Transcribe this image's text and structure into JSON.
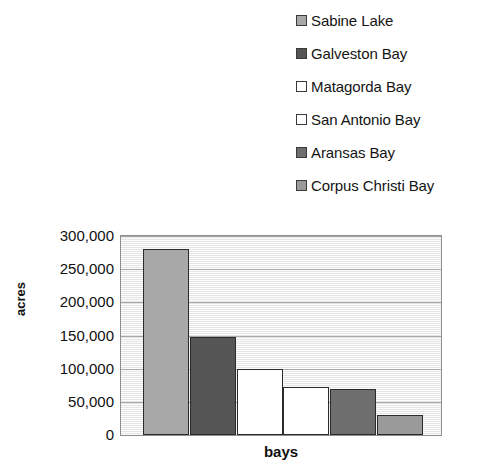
{
  "chart_data": {
    "type": "bar",
    "title": "",
    "xlabel": "bays",
    "ylabel": "acres",
    "categories": [
      "Sabine Lake",
      "Galveston Bay",
      "Matagorda Bay",
      "San Antonio Bay",
      "Aransas Bay",
      "Corpus Christi Bay"
    ],
    "values": [
      280000,
      148000,
      100000,
      72000,
      69000,
      30000
    ],
    "ylim": [
      0,
      300000
    ],
    "ytick_values": [
      0,
      50000,
      100000,
      150000,
      200000,
      250000,
      300000
    ],
    "ytick_labels": [
      "0",
      "50,000",
      "100,000",
      "150,000",
      "200,000",
      "250,000",
      "300,000"
    ],
    "grid": true,
    "legend_position": "top-right",
    "colors": [
      "#a8a8a8",
      "#555555",
      "#ffffff",
      "#ffffff",
      "#6e6e6e",
      "#9a9a9a"
    ],
    "bar_border_color": "#2b2b2b",
    "plot_background": "#f2f2f2",
    "gridline_color": "#a9a9a9"
  },
  "legend": {
    "items": [
      {
        "label": "Sabine Lake",
        "color": "#a8a8a8"
      },
      {
        "label": "Galveston Bay",
        "color": "#555555"
      },
      {
        "label": "Matagorda Bay",
        "color": "#ffffff"
      },
      {
        "label": "San Antonio Bay",
        "color": "#ffffff"
      },
      {
        "label": "Aransas Bay",
        "color": "#6e6e6e"
      },
      {
        "label": "Corpus Christi Bay",
        "color": "#9a9a9a"
      }
    ]
  }
}
